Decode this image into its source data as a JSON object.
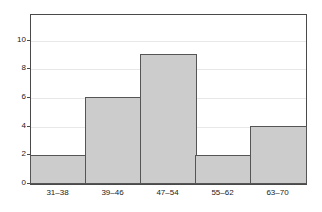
{
  "chart_data": {
    "type": "bar",
    "title": "",
    "subtitle": "",
    "xlabel": "",
    "ylabel": "",
    "categories": [
      "31–38",
      "39–46",
      "47–54",
      "55–62",
      "63–70"
    ],
    "values": [
      2,
      6,
      9,
      2,
      4
    ],
    "ylim": [
      0,
      11.8
    ],
    "yticks": [
      0,
      2,
      4,
      6,
      8,
      10
    ],
    "ytick_labels": [
      "0",
      "2",
      "4",
      "6",
      "8",
      "10"
    ],
    "grid": true,
    "grid_axis": "y",
    "legend": false,
    "legend_position": "none",
    "annotations": [],
    "series": [
      {
        "name": "Frequency",
        "values": [
          2,
          6,
          9,
          2,
          4
        ]
      }
    ]
  },
  "style": {
    "bar_fill": "#cccccc",
    "bar_edge": "#555555",
    "frame_color": "#4a4a4a",
    "grid_color": "#e8e8e8",
    "text_color": "#222222",
    "background": "#ffffff"
  }
}
